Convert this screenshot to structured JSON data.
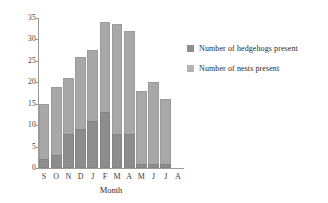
{
  "chart_data": {
    "type": "bar",
    "title": "",
    "subtitle": "",
    "xlabel": "Month",
    "ylabel": "",
    "categories": [
      "S",
      "O",
      "N",
      "D",
      "J",
      "F",
      "M",
      "A",
      "M",
      "J",
      "J",
      "A"
    ],
    "ylim": [
      0,
      35
    ],
    "yticks": [
      0,
      5,
      10,
      15,
      20,
      25,
      30,
      35
    ],
    "ytick_labels": [
      "0",
      "5",
      "10",
      "15",
      "20",
      "25",
      "30",
      "35"
    ],
    "grid": false,
    "legend_position": "right",
    "overlap": true,
    "series": [
      {
        "name": "Number of hedgehogs present",
        "color": "#8d8d8d",
        "values": [
          2,
          3,
          8,
          9,
          11,
          13,
          8,
          8,
          1,
          1,
          1,
          0
        ]
      },
      {
        "name": "Number of nests present",
        "color": "#b4b4b4",
        "values": [
          15,
          19,
          21,
          26,
          27.5,
          34,
          33.5,
          32,
          18,
          20,
          16,
          0
        ]
      }
    ]
  },
  "legend": {
    "entries": [
      {
        "label": "Number of hedgehogs present",
        "swatch": "legend-swatch-hedgehogs"
      },
      {
        "label": "Number of nests present",
        "swatch": "legend-swatch-nests"
      }
    ]
  },
  "axes": {
    "x_title": "Month"
  }
}
